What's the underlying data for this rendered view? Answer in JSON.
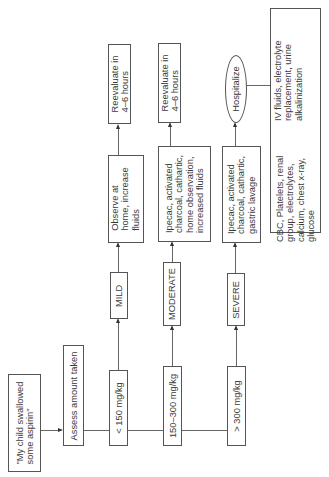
{
  "diagram": {
    "type": "flowchart",
    "orientation": "rotated -90deg (reads bottom-to-top)",
    "start": {
      "label": "\"My child swallowed\nsome aspirin\""
    },
    "assess": {
      "label": "Assess amount taken"
    },
    "branches": [
      {
        "dose": "< 150 mg/kg",
        "severity": "MILD",
        "treatment": "Observe at\nhome, increase\nfluids",
        "outcome": "Reevaluate in\n4–6 hours"
      },
      {
        "dose": "150–300 mg/kg",
        "severity": "MODERATE",
        "treatment": "Ipecac, activated\ncharcoal, cathartic,\nhome observation,\nincreased fluids",
        "outcome": "Reevaluate in\n4–6 hours"
      },
      {
        "dose": "> 300 mg/kg",
        "severity": "SEVERE",
        "treatment": "Ipecac, activated\ncharcoal, cathartic,\ngastric lavage",
        "outcome": "Hospitalize"
      }
    ],
    "hospital_care": {
      "labs": "CBC, Platelets, renal\ngroup, electrolytes,\ncalcium, chest x-ray,\nglucose",
      "therapy": "IV fluids, electrolyte\nreplacement, urine\nalkalinization"
    }
  }
}
